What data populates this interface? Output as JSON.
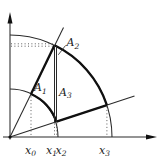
{
  "figure": {
    "background": "#ffffff",
    "line_color": "#1c1c1c",
    "region_labels": [
      {
        "main": "A",
        "sub": "1"
      },
      {
        "main": "A",
        "sub": "2"
      },
      {
        "main": "A",
        "sub": "3"
      }
    ],
    "axis_tick_labels": [
      {
        "main": "x",
        "sub": "0"
      },
      {
        "main": "x",
        "sub": "1"
      },
      {
        "main": "x",
        "sub": "2"
      },
      {
        "main": "x",
        "sub": "3"
      }
    ]
  }
}
